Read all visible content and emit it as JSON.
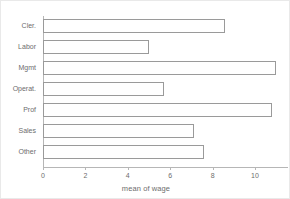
{
  "chart_data": {
    "type": "bar",
    "orientation": "horizontal",
    "title": "",
    "subtitle": "",
    "xlabel": "mean of wage",
    "ylabel": "",
    "categories": [
      "Cler.",
      "Labor",
      "Mgmt",
      "Operat.",
      "Prof",
      "Sales",
      "Other"
    ],
    "values": [
      8.6,
      5.0,
      11.0,
      5.7,
      10.8,
      7.1,
      7.6
    ],
    "series": [
      {
        "name": "mean of wage",
        "values": [
          8.6,
          5.0,
          11.0,
          5.7,
          10.8,
          7.1,
          7.6
        ]
      }
    ],
    "xlim": [
      0,
      11.6
    ],
    "ylim": [
      0,
      7
    ],
    "xticks": [
      0,
      2,
      4,
      6,
      8,
      10
    ],
    "xtick_labels": [
      "0",
      "2",
      "4",
      "6",
      "8",
      "10"
    ],
    "grid": false,
    "legend": false,
    "legend_position": "none",
    "bar_fill_color": "#ffffff",
    "bar_edge_color": "#9a9a9a",
    "axis_color": "#b6b6b6",
    "text_color": "#6d6d6d",
    "background_color": "#ffffff",
    "frame_color": "#e9e9e9"
  }
}
